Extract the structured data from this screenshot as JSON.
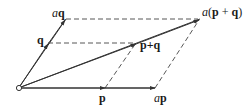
{
  "diagram": {
    "stroke_color": "#333333",
    "points": {
      "origin": {
        "x": 19,
        "y": 88
      },
      "p": {
        "x": 105,
        "y": 88
      },
      "ap": {
        "x": 155,
        "y": 88
      },
      "q": {
        "x": 48,
        "y": 43
      },
      "aq": {
        "x": 66,
        "y": 19
      },
      "p_plus_q": {
        "x": 136,
        "y": 43
      },
      "a_p_plus_q": {
        "x": 200,
        "y": 19
      }
    },
    "labels": {
      "aq": {
        "scalar": "a",
        "vec": "q"
      },
      "q": {
        "vec": "q"
      },
      "p_plus_q": {
        "text": "p+q"
      },
      "a_p_plus_q": {
        "scalar": "a",
        "open": "(",
        "p": "p",
        "plus": " + ",
        "q": "q",
        "close": ")"
      },
      "p": {
        "vec": "p"
      },
      "ap": {
        "scalar": "a",
        "vec": "p"
      }
    },
    "solid_vectors": [
      "O→p",
      "O→ap",
      "O→q",
      "O→aq",
      "O→p+q",
      "O→a(p+q)"
    ],
    "dashed_lines": [
      "aq—a(p+q)",
      "q—p+q",
      "p—p+q",
      "ap—a(p+q)"
    ]
  }
}
